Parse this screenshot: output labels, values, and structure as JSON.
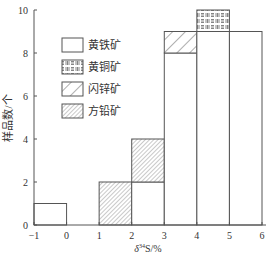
{
  "chart_data": {
    "type": "bar",
    "subtype": "stacked-histogram",
    "title": "",
    "xlabel": "δ34S/‰",
    "xlabel_parts": {
      "delta": "δ",
      "sup": "34",
      "rest": "S/%"
    },
    "ylabel": "样品数/个",
    "xlim": [
      -1,
      6
    ],
    "ylim": [
      0,
      10
    ],
    "x_ticks": [
      "-1",
      "0",
      "1",
      "2",
      "3",
      "4",
      "5",
      "6"
    ],
    "y_ticks": [
      "0",
      "2",
      "4",
      "6",
      "8",
      "10"
    ],
    "grid": false,
    "legend_position": "upper-left",
    "bins": [
      "[-1,0]",
      "[0,1]",
      "[1,2]",
      "[2,3]",
      "[3,4]",
      "[4,5]",
      "[5,6]"
    ],
    "series": [
      {
        "name": "黄铁矿",
        "pattern": "blank",
        "values": [
          1,
          0,
          0,
          2,
          8,
          9,
          9
        ]
      },
      {
        "name": "黄铜矿",
        "pattern": "grid",
        "values": [
          0,
          0,
          0,
          0,
          0,
          1,
          0
        ]
      },
      {
        "name": "闪锌矿",
        "pattern": "wide-hatch",
        "values": [
          0,
          0,
          0,
          0,
          1,
          0,
          0
        ]
      },
      {
        "name": "方铅矿",
        "pattern": "fine-hatch",
        "values": [
          0,
          0,
          2,
          2,
          0,
          0,
          0
        ]
      }
    ]
  },
  "legend": [
    {
      "label": "黄铁矿",
      "pattern": "blank"
    },
    {
      "label": "黄铜矿",
      "pattern": "grid"
    },
    {
      "label": "闪锌矿",
      "pattern": "wide-hatch"
    },
    {
      "label": "方铅矿",
      "pattern": "fine-hatch"
    }
  ],
  "colors": {
    "line": "#555555",
    "fill": "#ffffff",
    "hatch": "#666666"
  }
}
